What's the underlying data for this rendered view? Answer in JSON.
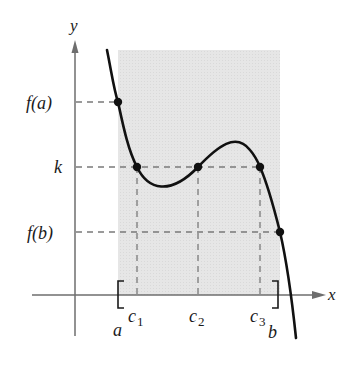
{
  "figure": {
    "axes": {
      "x_label": "x",
      "y_label": "y"
    },
    "y_tick_labels": {
      "fa": "f(a)",
      "k": "k",
      "fb": "f(b)"
    },
    "x_tick_labels": {
      "a": "a",
      "b": "b",
      "c1_base": "c",
      "c1_sub": "1",
      "c2_base": "c",
      "c2_sub": "2",
      "c3_base": "c",
      "c3_sub": "3"
    },
    "interval": {
      "left_bracket": "[",
      "right_bracket": "]"
    },
    "colors": {
      "shade": "#e4e4e4",
      "curve": "#111111",
      "axis": "#6e6e6e",
      "dashed": "#7a7a7a"
    },
    "points": [
      {
        "name": "f(a)",
        "x": 118,
        "y": 102
      },
      {
        "name": "c1,k",
        "x": 137,
        "y": 167
      },
      {
        "name": "c2,k",
        "x": 198,
        "y": 167
      },
      {
        "name": "c3,k",
        "x": 260,
        "y": 167
      },
      {
        "name": "f(b)",
        "x": 280,
        "y": 232
      }
    ]
  }
}
